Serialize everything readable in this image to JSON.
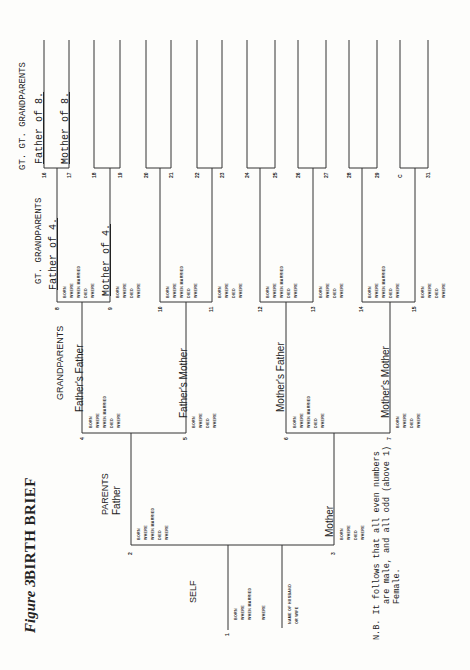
{
  "title": {
    "figure": "Figure 3",
    "main": "BIRTH BRIEF"
  },
  "sections": {
    "self": "SELF",
    "parents": "PARENTS",
    "grandparents": "GRANDPARENTS",
    "great_grandparents": "GT. GRANDPARENTS",
    "great_great_grandparents": "GT. GT. GRANDPARENTS"
  },
  "people": {
    "p1": {
      "number": "1",
      "name": ""
    },
    "p2": {
      "number": "2",
      "name": "Father"
    },
    "p3": {
      "number": "3",
      "name": "Mother"
    },
    "p4": {
      "number": "4",
      "name": "Father's Father"
    },
    "p5": {
      "number": "5",
      "name": "Father's Mother"
    },
    "p6": {
      "number": "6",
      "name": "Mother's Father"
    },
    "p7": {
      "number": "7",
      "name": "Mother's Mother"
    },
    "p8": {
      "number": "8",
      "name": "Father of 4."
    },
    "p9": {
      "number": "9",
      "name": "Mother of 4."
    },
    "p10": {
      "number": "10"
    },
    "p11": {
      "number": "11"
    },
    "p12": {
      "number": "12"
    },
    "p13": {
      "number": "13"
    },
    "p14": {
      "number": "14"
    },
    "p15": {
      "number": "15"
    },
    "p16": {
      "number": "16",
      "name": "Father of 8."
    },
    "p17": {
      "number": "17",
      "name": "Mother of 8."
    },
    "p18": {
      "number": "18"
    },
    "p19": {
      "number": "19"
    },
    "p20": {
      "number": "20"
    },
    "p21": {
      "number": "21"
    },
    "p22": {
      "number": "22"
    },
    "p23": {
      "number": "23"
    },
    "p24": {
      "number": "24"
    },
    "p25": {
      "number": "25"
    },
    "p26": {
      "number": "26"
    },
    "p27": {
      "number": "27"
    },
    "p28": {
      "number": "28"
    },
    "p29": {
      "number": "29"
    },
    "p30": {
      "number": "C"
    },
    "p31": {
      "number": "31"
    }
  },
  "fields": {
    "born": "BORN",
    "where": "WHERE",
    "when_married": "WHEN MARRIED",
    "died": "DIED",
    "spouse": "NAME OF HUSBAND",
    "spouse2": "OR WIFE"
  },
  "note": {
    "line1": "N.B.  It follows that all even numbers",
    "line2": "are male, and all odd (above 1)",
    "line3": "Female."
  }
}
